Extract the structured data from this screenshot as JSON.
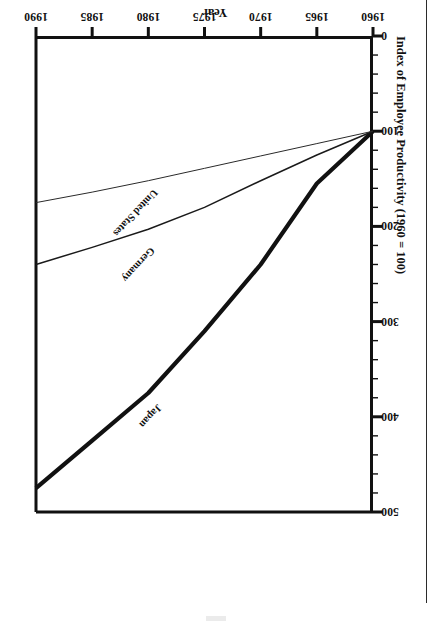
{
  "figure": {
    "orientation": "rotated-180",
    "x_axis_title": "Year",
    "y_axis_title": "Index of Employee Productivity (1960 = 100)"
  },
  "chart_data": {
    "type": "line",
    "title": "",
    "xlabel": "Year",
    "ylabel": "Index of Employee Productivity (1960 = 100)",
    "xlim": [
      1960,
      1990
    ],
    "ylim": [
      0,
      500
    ],
    "xticks": [
      1960,
      1965,
      1970,
      1975,
      1980,
      1985,
      1990
    ],
    "xtick_labels": [
      "1960",
      "1965",
      "1970",
      "1975",
      "1980",
      "1985",
      "1990"
    ],
    "yticks": [
      0,
      100,
      200,
      300,
      400,
      500
    ],
    "ytick_labels": [
      "0",
      "100",
      "200",
      "300",
      "400",
      "500"
    ],
    "y_minor_ticks": [
      20,
      40,
      60,
      80,
      120,
      140,
      160,
      180,
      220,
      240,
      260,
      280,
      320,
      340,
      360,
      380,
      420,
      440,
      460,
      480
    ],
    "grid": false,
    "legend_position": "inline-labels",
    "x": [
      1960,
      1965,
      1970,
      1975,
      1980,
      1985,
      1990
    ],
    "series": [
      {
        "name": "Japan",
        "label": "Japan",
        "values": [
          100,
          155,
          240,
          310,
          375,
          425,
          475
        ],
        "line_width": 4.2,
        "color": "#111111",
        "label_x": 1978.6,
        "label_y": 393,
        "label_rotation": -47
      },
      {
        "name": "Germany",
        "label": "Germany",
        "values": [
          100,
          125,
          152,
          180,
          203,
          222,
          240
        ],
        "line_width": 1.5,
        "color": "#1a1a1a",
        "label_x": 1979.2,
        "label_y": 228,
        "label_rotation": -47
      },
      {
        "name": "United States",
        "label": "United States",
        "values": [
          100,
          113,
          126,
          139,
          152,
          164,
          175
        ],
        "line_width": 1.0,
        "color": "#2a2a2a",
        "label_x": 1979.0,
        "label_y": 167,
        "label_rotation": -47
      }
    ]
  }
}
